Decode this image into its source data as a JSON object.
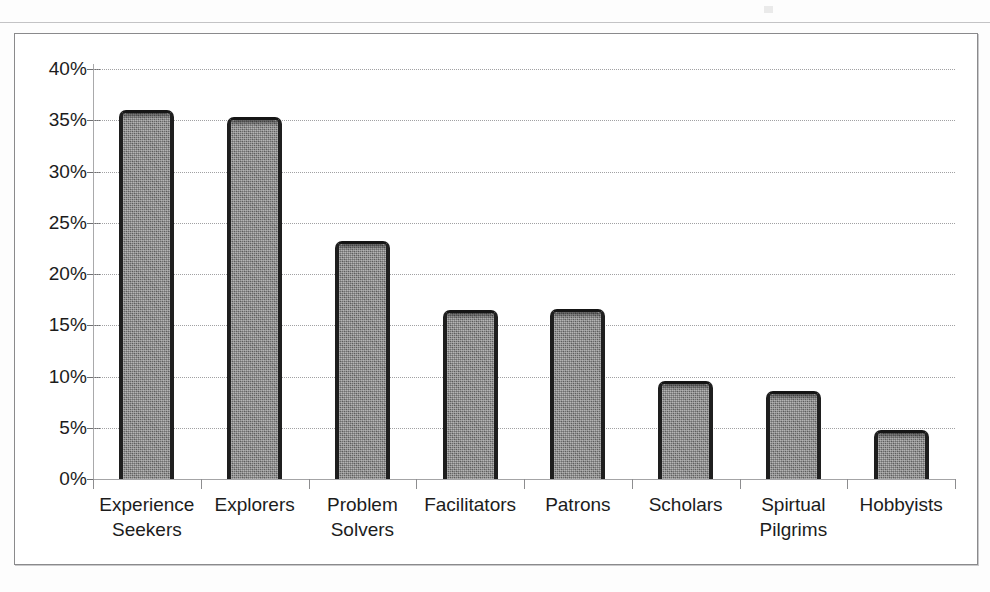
{
  "chart_data": {
    "type": "bar",
    "title": "",
    "subtitle": "",
    "xlabel": "",
    "ylabel": "",
    "categories": [
      "Experience Seekers",
      "Explorers",
      "Problem Solvers",
      "Facilitators",
      "Patrons",
      "Scholars",
      "Spirtual Pilgrims",
      "Hobbyists"
    ],
    "category_lines": [
      [
        "Experience",
        "Seekers"
      ],
      [
        "Explorers"
      ],
      [
        "Problem",
        "Solvers"
      ],
      [
        "Facilitators"
      ],
      [
        "Patrons"
      ],
      [
        "Scholars"
      ],
      [
        "Spirtual",
        "Pilgrims"
      ],
      [
        "Hobbyists"
      ]
    ],
    "values": [
      36.0,
      35.3,
      23.2,
      16.5,
      16.6,
      9.6,
      8.6,
      4.8
    ],
    "value_labels": [
      "36%",
      "35.3%",
      "23.2%",
      "16.5%",
      "16.6%",
      "9.6%",
      "8.6%",
      "4.8%"
    ],
    "ylim": [
      0,
      40
    ],
    "ytick_values": [
      0,
      5,
      10,
      15,
      20,
      25,
      30,
      35,
      40
    ],
    "ytick_labels": [
      "0%",
      "5%",
      "10%",
      "15%",
      "20%",
      "25%",
      "30%",
      "35%",
      "40%"
    ],
    "grid": true,
    "grid_style": "dotted",
    "legend": false,
    "legend_position": "none",
    "bar_color": "#6e6e6e",
    "bar_edge_color": "#1e1e1e",
    "gridline_color": "#9d9d9f",
    "axis_color": "#a9a9ab",
    "frame_color": "#8a8a8c",
    "background_color": "#ffffff",
    "text_color": "#1c1c1c"
  }
}
